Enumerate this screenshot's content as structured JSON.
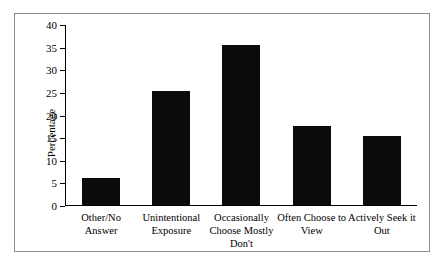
{
  "chart_data": {
    "type": "bar",
    "title": "",
    "xlabel": "",
    "ylabel": "Percentage",
    "ylim": [
      0,
      40
    ],
    "yticks": [
      0,
      5,
      10,
      15,
      20,
      25,
      30,
      35,
      40
    ],
    "grid": false,
    "legend": null,
    "bar_color": "#0b0b0b",
    "categories": [
      "Other/No Answer",
      "Unintentional Exposure",
      "Occasionally Choose Mostly Don't",
      "Often Choose to View",
      "Actively Seek it Out"
    ],
    "category_lines": [
      [
        "Other/No",
        "Answer"
      ],
      [
        "Unintentional",
        "Exposure"
      ],
      [
        "Occasionally",
        "Choose Mostly",
        "Don't"
      ],
      [
        "Often Choose to",
        "View"
      ],
      [
        "Actively Seek it",
        "Out"
      ]
    ],
    "values": [
      6.0,
      25.2,
      35.4,
      17.5,
      15.3
    ]
  }
}
